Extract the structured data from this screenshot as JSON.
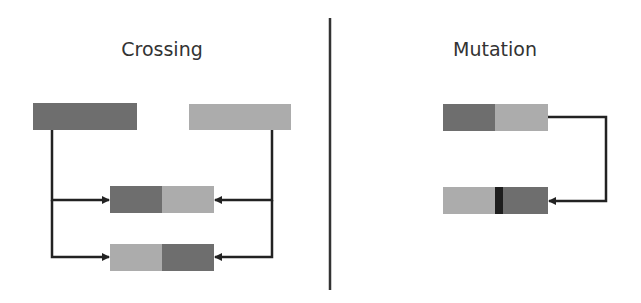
{
  "colors": {
    "dark_gene": "#6e6e6e",
    "light_gene": "#acacac",
    "mutation_marker": "#1e1e1e",
    "line": "#222222",
    "divider": "#333333",
    "text": "#333333"
  },
  "sections": {
    "crossing": {
      "title": "Crossing",
      "parents": [
        {
          "label": "parent-a",
          "color": "dark"
        },
        {
          "label": "parent-b",
          "color": "light"
        }
      ],
      "offspring": [
        {
          "label": "child-1",
          "segments": [
            "dark",
            "light"
          ]
        },
        {
          "label": "child-2",
          "segments": [
            "light",
            "dark"
          ]
        }
      ]
    },
    "mutation": {
      "title": "Mutation",
      "original": {
        "segments": [
          "dark",
          "light"
        ]
      },
      "mutated": {
        "segments": [
          "light",
          "mutation-marker",
          "dark"
        ]
      }
    }
  }
}
